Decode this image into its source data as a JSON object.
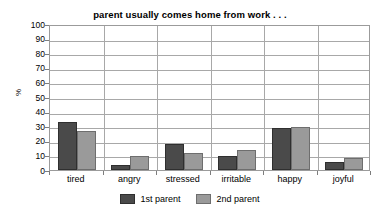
{
  "chart_data": {
    "type": "bar",
    "title": "parent usually comes home from work . . .",
    "xlabel": "",
    "ylabel": "%",
    "ylim": [
      0,
      100
    ],
    "ytick_step": 10,
    "ytick_labels": [
      "100",
      "90",
      "80",
      "70",
      "60",
      "50",
      "40",
      "30",
      "20",
      "10",
      "0"
    ],
    "ytick_values": [
      100,
      90,
      80,
      70,
      60,
      50,
      40,
      30,
      20,
      10,
      0
    ],
    "grid": "horizontal-and-group-separators",
    "legend_position": "bottom-center",
    "categories": [
      "tired",
      "angry",
      "stressed",
      "irritable",
      "happy",
      "joyful"
    ],
    "series": [
      {
        "name": "1st parent",
        "color": "#4a4a4a",
        "values": [
          33,
          3.5,
          18,
          9.5,
          29,
          5.5
        ]
      },
      {
        "name": "2nd parent",
        "color": "#9a9a9a",
        "values": [
          27,
          9.5,
          11.5,
          13.5,
          29.5,
          8
        ]
      }
    ]
  },
  "colors": {
    "series1": "#4a4a4a",
    "series2": "#9a9a9a",
    "gridline": "#a8a8a8",
    "axis_border": "#9b9b9b",
    "text": "#000000",
    "background": "#ffffff"
  }
}
